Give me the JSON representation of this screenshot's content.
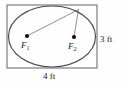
{
  "figure": {
    "kind": "ellipse-inscribed-in-rectangle-diagram",
    "background_color": "#fefefe",
    "stroke_color": "#4a4a4a",
    "rect_stroke_color": "#6e6e6e",
    "thin_stroke_color": "#555555",
    "dot_color": "#111111",
    "text_color": "#1a1a1a"
  },
  "rectangle": {
    "name": "bounding-rectangle",
    "x": 7,
    "y": 5,
    "width": 90,
    "height": 63
  },
  "ellipse": {
    "name": "inscribed-ellipse",
    "cx": 52,
    "cy": 36.5,
    "rx": 43.5,
    "ry": 30.5
  },
  "foci": [
    {
      "id": "f1",
      "label": "F",
      "subscript": "1",
      "dot_x": 27,
      "dot_y": 36,
      "dot_r": 2.1
    },
    {
      "id": "f2",
      "label": "F",
      "subscript": "2",
      "dot_x": 74,
      "dot_y": 37,
      "dot_r": 2.1
    }
  ],
  "point_on_ellipse": {
    "name": "point-on-ellipse",
    "x": 78.5,
    "y": 9.5
  },
  "focal_radii": [
    {
      "id": "segment-f1-to-point",
      "x1": 27,
      "y1": 36,
      "x2": 78.5,
      "y2": 9.5
    },
    {
      "id": "segment-f2-to-point",
      "x1": 74,
      "y1": 37,
      "x2": 78.5,
      "y2": 9.5
    }
  ],
  "dimensions": {
    "height_label": "3 ft",
    "width_label": "4 ft",
    "height_value": 3,
    "width_value": 4,
    "unit": "ft"
  }
}
